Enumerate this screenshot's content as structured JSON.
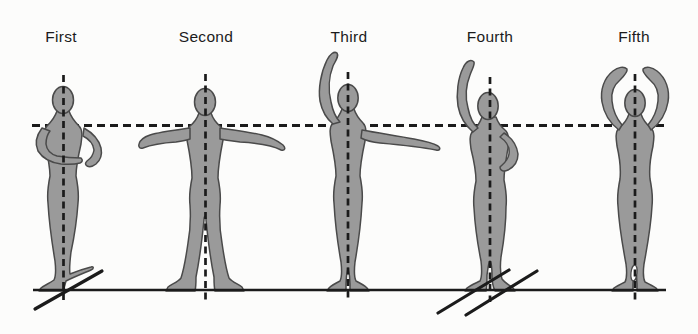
{
  "positions": [
    {
      "label": "First"
    },
    {
      "label": "Second"
    },
    {
      "label": "Third"
    },
    {
      "label": "Fourth"
    },
    {
      "label": "Fifth"
    }
  ],
  "figures": [
    {
      "icon": "ballet-figure-first-position",
      "pose": "arms rounded low in front, heels together with feet turned out along a diagonal"
    },
    {
      "icon": "ballet-figure-second-position",
      "pose": "arms extended horizontally to both sides, feet apart and turned out"
    },
    {
      "icon": "ballet-figure-third-position",
      "pose": "left arm raised overhead, right arm extended to the side"
    },
    {
      "icon": "ballet-figure-fourth-position",
      "pose": "left arm raised overhead, right hand on hip, one foot placed in front of the other"
    },
    {
      "icon": "ballet-figure-fifth-position",
      "pose": "both arms raised overhead in an oval, feet crossed closely together"
    }
  ],
  "guides": {
    "shoulder_guide": "horizontal dashed line at shoulder height across all figures",
    "plumb_line": "vertical dashed centre line through each figure",
    "ground": "solid baseline under all figures",
    "foot_angle_marks": "solid diagonal lines showing foot turnout at First and Fourth positions"
  },
  "colors": {
    "background": "#fcfcfb",
    "figure-fill": "#9a9a9a",
    "figure-outline": "#4a4a4a",
    "line": "#1b1b1b",
    "label-text": "#1b1b1b"
  }
}
